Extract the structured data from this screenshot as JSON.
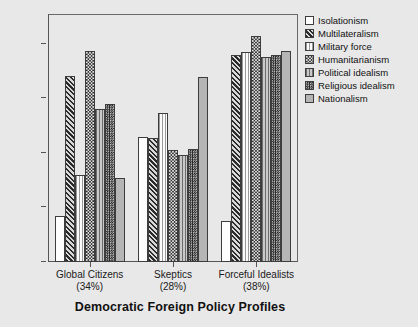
{
  "chart_data": {
    "type": "bar",
    "title": "",
    "xlabel": "Democratic Foreign Policy Profiles",
    "ylabel": "Mean",
    "categories": [
      "Global Citizens",
      "Skeptics",
      "Forceful Idealists"
    ],
    "category_sublabels": [
      "(34%)",
      "(28%)",
      "(38%)"
    ],
    "ylim": [
      2,
      6.55
    ],
    "yticks": [
      2,
      3,
      4,
      5,
      6
    ],
    "ytick_labels": [
      "2",
      "3",
      "4",
      "5",
      "6"
    ],
    "grid": false,
    "legend_position": "right",
    "series": [
      {
        "name": "Isolationism",
        "pattern": "solid-white",
        "values": [
          2.85,
          4.3,
          2.75
        ]
      },
      {
        "name": "Multilateralism",
        "pattern": "diagonal-hatch",
        "values": [
          5.42,
          4.27,
          5.8
        ]
      },
      {
        "name": "Military force",
        "pattern": "light-vertical",
        "values": [
          3.6,
          4.73,
          5.85
        ]
      },
      {
        "name": "Humanitarianism",
        "pattern": "checkerboard",
        "values": [
          5.87,
          4.06,
          6.15
        ]
      },
      {
        "name": "Political idealism",
        "pattern": "vertical-lines",
        "values": [
          4.81,
          3.96,
          5.76
        ]
      },
      {
        "name": "Religious idealism",
        "pattern": "dense-checkerboard",
        "values": [
          4.9,
          4.07,
          5.8
        ]
      },
      {
        "name": "Nationalism",
        "pattern": "solid-gray",
        "values": [
          3.55,
          5.4,
          5.87
        ]
      }
    ]
  },
  "colors": {
    "background": "#e8e8e8",
    "axis": "#555555",
    "text": "#1a1a1a"
  }
}
